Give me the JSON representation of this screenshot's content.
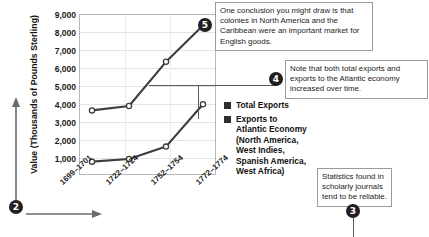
{
  "chart_data": {
    "type": "line",
    "title": "",
    "xlabel": "",
    "ylabel": "Value (Thousands of Pounds Sterling)",
    "categories": [
      "1699–1701",
      "1722–1724",
      "1752–1754",
      "1772–1774"
    ],
    "ylim": [
      0,
      9000
    ],
    "yticks": [
      "1,000",
      "2,000",
      "3,000",
      "4,000",
      "5,000",
      "6,000",
      "7,000",
      "8,000",
      "9,000"
    ],
    "ytick_values": [
      1000,
      2000,
      3000,
      4000,
      5000,
      6000,
      7000,
      8000,
      9000
    ],
    "grid": true,
    "legend_position": "right",
    "series": [
      {
        "name": "Total Exports",
        "values": [
          3600,
          3850,
          6350,
          8400
        ],
        "color": "#3d3d3d"
      },
      {
        "name": "Exports to Atlantic Economy (North America, West Indies, Spanish America, West Africa)",
        "values": [
          700,
          850,
          1550,
          3950
        ],
        "color": "#3d3d3d"
      }
    ]
  },
  "legend": {
    "items": [
      {
        "label": "Total Exports",
        "swatch_color": "#2f2f2f"
      },
      {
        "label": "Exports to Atlantic Economy (North America, West Indies, Spanish America, West Africa)",
        "swatch_color": "#2f2f2f"
      }
    ]
  },
  "annotations": {
    "callout_5": {
      "number": "5",
      "text": "One conclusion you might draw is that colonies in North America and the Caribbean were an important market for English goods."
    },
    "callout_4": {
      "number": "4",
      "text": "Note that both total exports and exports to the Atlantic economy increased over time."
    },
    "callout_3": {
      "number": "3",
      "text": "Statistics found in scholarly journals tend to be reliable."
    },
    "marker_2": {
      "number": "2"
    }
  },
  "source": {
    "text": ""
  }
}
